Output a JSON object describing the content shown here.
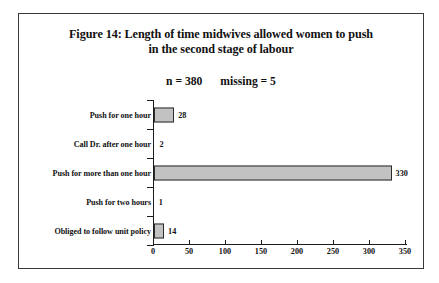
{
  "figure": {
    "title_line_1": "Figure 14: Length of time midwives allowed women to push",
    "title_line_2": "in the second stage of labour",
    "sample_size": "n = 380",
    "missing": "missing = 5"
  },
  "chart_data": {
    "type": "bar",
    "orientation": "horizontal",
    "title": "Figure 14: Length of time midwives allowed women to push in the second stage of labour",
    "subtitle": "n = 380    missing = 5",
    "xlabel": "",
    "ylabel": "",
    "categories": [
      "Push for one hour",
      "Call Dr. after one hour",
      "Push for more than one hour",
      "Push for two hours",
      "Obliged to follow unit policy"
    ],
    "values": [
      28,
      2,
      330,
      1,
      14
    ],
    "value_labels": [
      "28",
      "2",
      "330",
      "1",
      "14"
    ],
    "xlim": [
      0,
      350
    ],
    "xticks": [
      0,
      50,
      100,
      150,
      200,
      250,
      300,
      350
    ],
    "xtick_labels": [
      "0",
      "50",
      "100",
      "150",
      "200",
      "250",
      "300",
      "350"
    ],
    "grid": false,
    "legend": false,
    "bar_fill_color": "#c2c2c2",
    "bar_edge_color": "#2b2b2b",
    "axis_color": "#1c1c1c",
    "frame_color": "#3a3a3a",
    "background_color": "#ffffff"
  }
}
